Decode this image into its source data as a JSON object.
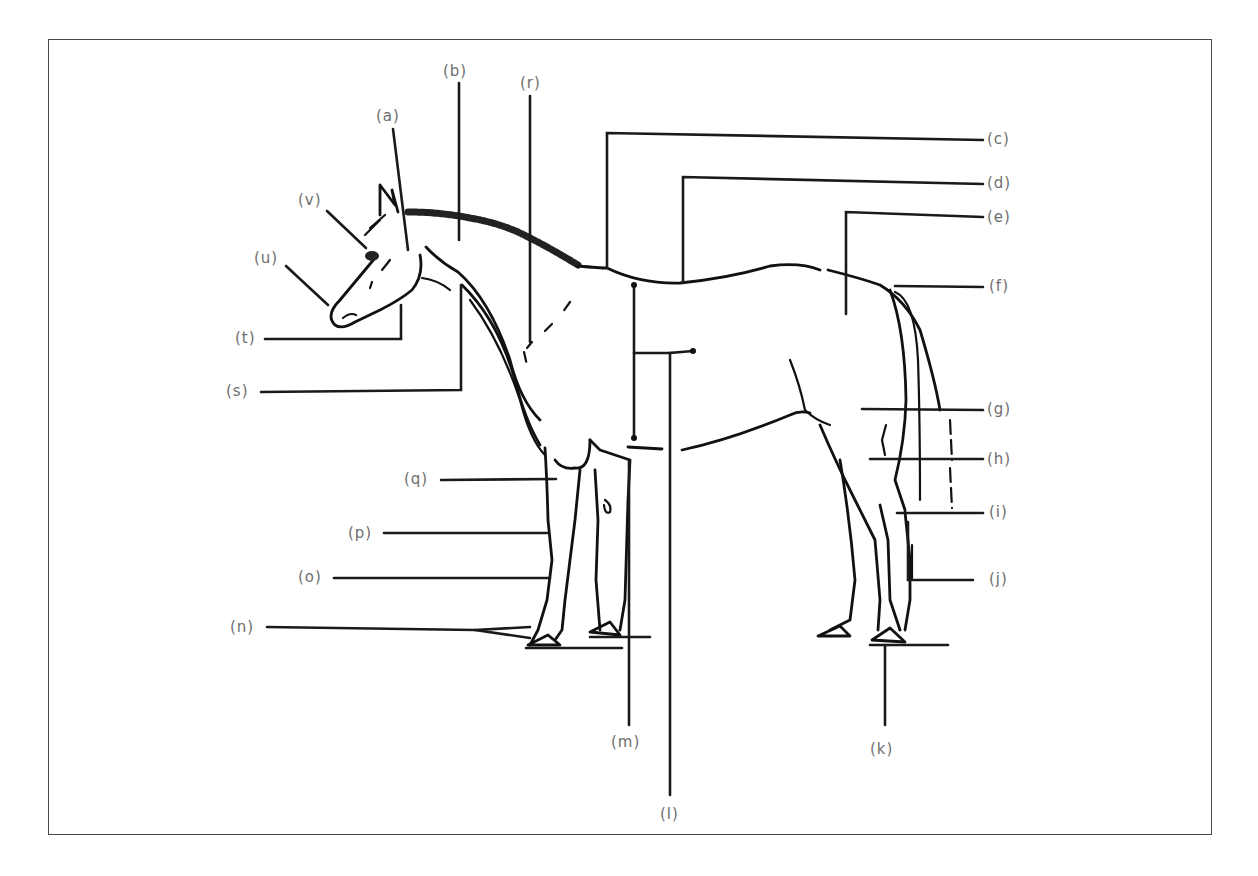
{
  "diagram": {
    "labels": {
      "a": "(a)",
      "b": "(b)",
      "c": "(c)",
      "d": "(d)",
      "e": "(e)",
      "f": "(f)",
      "g": "(g)",
      "h": "(h)",
      "i": "(i)",
      "j": "(j)",
      "k": "(k)",
      "l": "(l)",
      "m": "(m)",
      "n": "(n)",
      "o": "(o)",
      "p": "(p)",
      "q": "(q)",
      "r": "(r)",
      "s": "(s)",
      "t": "(t)",
      "u": "(u)",
      "v": "(v)"
    },
    "colors": {
      "line": "#111111",
      "label": "#6e6e6e",
      "frame": "#4a4a4a",
      "background": "#ffffff"
    }
  }
}
